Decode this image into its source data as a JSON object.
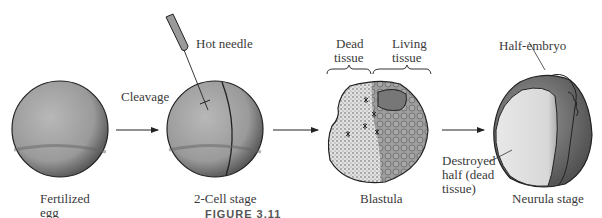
{
  "diagram": {
    "stages": [
      {
        "id": "fertilized-egg",
        "label_line1": "Fertilized",
        "label_line2": "egg"
      },
      {
        "id": "two-cell",
        "label": "2-Cell stage"
      },
      {
        "id": "blastula",
        "label": "Blastula"
      },
      {
        "id": "neurula",
        "label": "Neurula stage"
      }
    ],
    "arrows": [
      {
        "label": "Cleavage"
      },
      {
        "label": ""
      },
      {
        "label": ""
      }
    ],
    "annotations": {
      "hot_needle": "Hot needle",
      "dead_tissue_line1": "Dead",
      "dead_tissue_line2": "tissue",
      "living_tissue_line1": "Living",
      "living_tissue_line2": "tissue",
      "half_embryo": "Half-embryo",
      "destroyed_line1": "Destroyed",
      "destroyed_line2": "half (dead",
      "destroyed_line3": "tissue)"
    },
    "caption_fragment": "FIGURE 3.11"
  },
  "colors": {
    "egg_fill": "#a9a9a9",
    "egg_dark": "#5a5a5a",
    "dead_fill": "#dcdcdc",
    "outline": "#222222",
    "text": "#3a3a3a"
  }
}
